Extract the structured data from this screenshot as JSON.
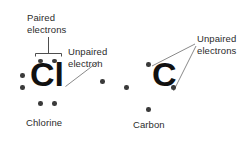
{
  "figure": {
    "type": "lewis-dot-structure-diagram",
    "background_color": "#ffffff",
    "text_color": "#2b2b2b",
    "dot_color": "#3a3a3a",
    "symbol_color": "#111111",
    "leader_color": "#6b6b6b"
  },
  "annotations": {
    "paired_electrons": {
      "line1": "Paired",
      "line2": "electrons"
    },
    "unpaired_electron_singular": {
      "line1": "Unpaired",
      "line2": "electron"
    },
    "unpaired_electrons_plural": {
      "line1": "Unpaired",
      "line2": "electrons"
    }
  },
  "atoms": [
    {
      "id": "chlorine",
      "symbol": "Cl",
      "caption": "Chlorine",
      "valence_electrons": 7,
      "lone_pairs": 3,
      "unpaired_electrons": 1,
      "dot_groups": [
        {
          "position": "top",
          "count": 2,
          "kind": "paired"
        },
        {
          "position": "bottom",
          "count": 2,
          "kind": "paired"
        },
        {
          "position": "left",
          "count": 2,
          "kind": "paired"
        },
        {
          "position": "right",
          "count": 1,
          "kind": "unpaired"
        }
      ]
    },
    {
      "id": "carbon",
      "symbol": "C",
      "caption": "Carbon",
      "valence_electrons": 4,
      "lone_pairs": 0,
      "unpaired_electrons": 4,
      "dot_groups": [
        {
          "position": "top",
          "count": 1,
          "kind": "unpaired"
        },
        {
          "position": "bottom",
          "count": 1,
          "kind": "unpaired"
        },
        {
          "position": "left",
          "count": 1,
          "kind": "unpaired"
        },
        {
          "position": "right",
          "count": 1,
          "kind": "unpaired"
        }
      ]
    }
  ]
}
